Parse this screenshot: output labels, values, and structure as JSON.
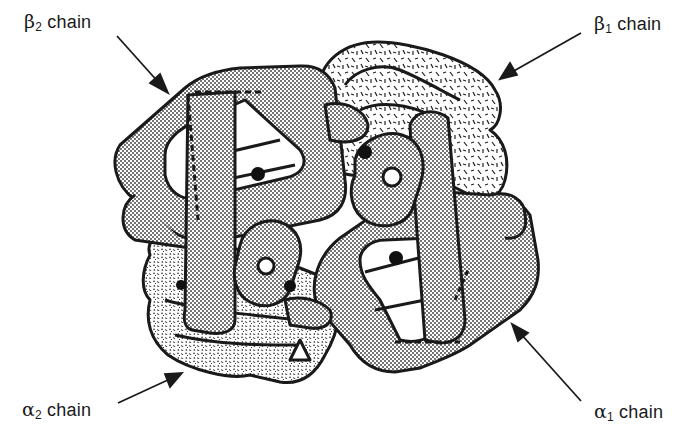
{
  "figure": {
    "colors": {
      "outline": "#1a1a1a",
      "background": "#ffffff",
      "dot_fill": "#c8c8c8",
      "heme_dot": "#111111"
    }
  },
  "labels": [
    {
      "id": "beta2",
      "greek": "β",
      "subscript": "2",
      "text": "chain",
      "position": "top-left"
    },
    {
      "id": "beta1",
      "greek": "β",
      "subscript": "1",
      "text": "chain",
      "position": "top-right"
    },
    {
      "id": "alpha2",
      "greek": "α",
      "subscript": "2",
      "text": "chain",
      "position": "bottom-left"
    },
    {
      "id": "alpha1",
      "greek": "α",
      "subscript": "1",
      "text": "chain",
      "position": "bottom-right"
    }
  ],
  "chains": [
    {
      "name": "β2 chain",
      "fill_pattern": "fine-dots",
      "heme_count": 1
    },
    {
      "name": "β1 chain",
      "fill_pattern": "dashes",
      "heme_count": 1
    },
    {
      "name": "α2 chain",
      "fill_pattern": "stipple",
      "heme_count": 1
    },
    {
      "name": "α1 chain",
      "fill_pattern": "fine-dots",
      "heme_count": 1
    }
  ]
}
